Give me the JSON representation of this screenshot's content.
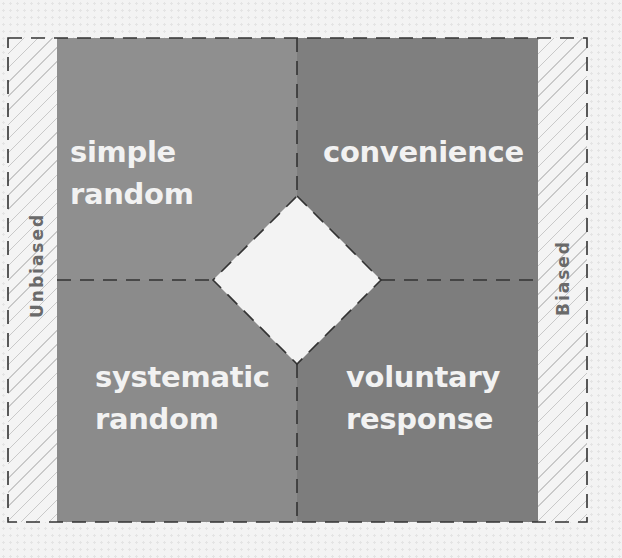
{
  "diagram": {
    "colors": {
      "top_left": "#8f8f8f",
      "top_right": "#7f7f7f",
      "bottom_left": "#8b8b8b",
      "bottom_right": "#7d7d7d",
      "label_text": "#f2f2f2",
      "side_text": "#6a6a6a",
      "dashes": "#333333"
    },
    "quadrants": {
      "top_left": "simple random",
      "top_right": "convenience",
      "bottom_left": "systematic\nrandom",
      "bottom_right": "voluntary\nresponse"
    },
    "axis": {
      "left_label": "Unbiased",
      "right_label": "Biased"
    }
  }
}
